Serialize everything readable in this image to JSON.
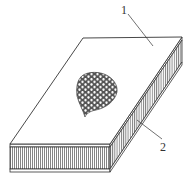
{
  "diagram": {
    "labels": [
      {
        "id": "1",
        "text": "1",
        "refers_to": "face-sheet"
      },
      {
        "id": "2",
        "text": "2",
        "refers_to": "honeycomb-core"
      }
    ],
    "colors": {
      "line": "#333333",
      "background": "#ffffff",
      "core_hatch": "#555555",
      "cells": "#555555"
    }
  }
}
